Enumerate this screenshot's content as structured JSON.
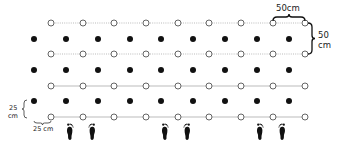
{
  "diagram": {
    "title": "",
    "open_columns_x": [
      51,
      83,
      114,
      146,
      178,
      209,
      241,
      273,
      305
    ],
    "filled_columns_x": [
      34,
      66,
      98,
      130,
      161,
      193,
      225,
      257,
      289
    ],
    "open_rows": [
      {
        "y": 23,
        "line_style": "dotted"
      },
      {
        "y": 54,
        "line_style": "dotted"
      },
      {
        "y": 86,
        "line_style": "solid"
      },
      {
        "y": 117,
        "line_style": "solid"
      }
    ],
    "filled_rows_y": [
      39,
      70,
      101
    ],
    "footprint_pairs_x": [
      [
        70,
        92
      ],
      [
        165,
        187
      ],
      [
        260,
        282
      ]
    ],
    "footprint_y": 131,
    "labels": {
      "top_spacing": "50cm",
      "right_spacing_line1": "50",
      "right_spacing_line2": "cm",
      "left_spacing_line1": "25",
      "left_spacing_line2": "cm",
      "bottom_spacing": "25 cm"
    },
    "legend": {
      "open_marker": "open circle",
      "filled_marker": "filled circle"
    },
    "colors": {
      "filled": "#111111",
      "open_stroke": "#555555",
      "line": "#bbbbbb",
      "footprint": "#111111"
    }
  }
}
